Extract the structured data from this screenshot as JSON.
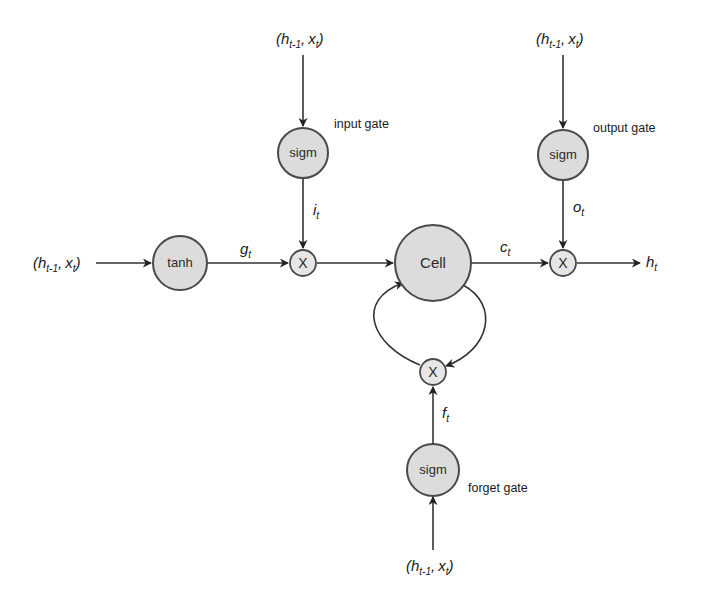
{
  "diagram": {
    "type": "LSTM cell",
    "nodes": {
      "tanh": {
        "label": "tanh"
      },
      "input_sigm": {
        "label": "sigm"
      },
      "output_sigm": {
        "label": "sigm"
      },
      "forget_sigm": {
        "label": "sigm"
      },
      "cell": {
        "label": "Cell"
      },
      "input_mult": {
        "label": "X"
      },
      "output_mult": {
        "label": "X"
      },
      "forget_mult": {
        "label": "X"
      }
    },
    "gate_labels": {
      "input": "input gate",
      "output": "output gate",
      "forget": "forget gate"
    },
    "inputs": {
      "paren_open": "(",
      "h": "h",
      "h_sub": "t-1",
      "comma": ",",
      "x": "x",
      "x_sub": "t",
      "paren_close": ")"
    },
    "edge_labels": {
      "g": {
        "main": "g",
        "sub": "t"
      },
      "i": {
        "main": "i",
        "sub": "t"
      },
      "o": {
        "main": "o",
        "sub": "t"
      },
      "c": {
        "main": "c",
        "sub": "t"
      },
      "f": {
        "main": "f",
        "sub": "t"
      },
      "h_out": {
        "main": "h",
        "sub": "t"
      }
    }
  }
}
